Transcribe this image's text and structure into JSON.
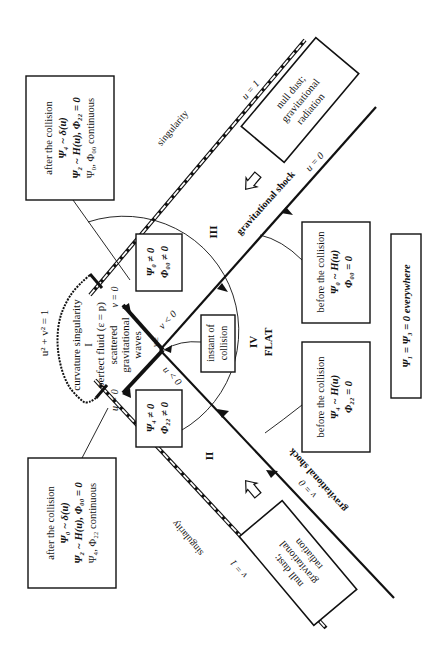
{
  "diagram": {
    "orientation": "rotated 90 degrees counter-clockwise",
    "regions": {
      "I": "I",
      "II": "II",
      "III": "III",
      "IV": "IV",
      "flat": "FLAT"
    },
    "region_I_text": {
      "singularity": "curvature singularity",
      "fluid": "perfect fluid (ε = p)",
      "scattered": "scattered",
      "gravitational": "gravitational",
      "waves": "waves"
    },
    "circle_label": "u² + v² = 1",
    "axis_labels": {
      "u_eq_0_top": "u = 0",
      "v_eq_0_bottom": "v = 0",
      "u_eq_1": "u = 1",
      "v_eq_1": "v = 1",
      "v_eq_0_left": "v = 0",
      "u_eq_0_left": "u = 0",
      "v_lt_0": "v < 0",
      "u_lt_0": "u < 0",
      "v_ge": "v ≥",
      "u_ge": "u ≥"
    },
    "singularity_top": "singularity",
    "singularity_bottom": "singularity",
    "shock_top": "gravitational shock",
    "shock_bottom": "gravitational shock",
    "null_dust_top": [
      "null dust;",
      "gravitational",
      "radiation"
    ],
    "null_dust_bottom": [
      "null dust;",
      "gravitational",
      "radiation"
    ],
    "after_top": {
      "title": "after the collision",
      "line1": "Ψ₄ ~ δ(u)",
      "line2": "Ψ₂ ~ H(u),  Φ₂₂ = 0",
      "line3": "Ψ₀, Φ₀₀ continuous"
    },
    "after_bottom": {
      "title": "after the collision",
      "line1": "Ψ₀ ~ δ(u)",
      "line2": "Ψ₂ ~ H(u),  Φ₀₀ = 0",
      "line3": "Ψ₄, Φ₂₂ continuous"
    },
    "box_psi0": {
      "line1": "Ψ₀ ≠ 0",
      "line2": "Φ₀₀ ≠ 0"
    },
    "box_psi4": {
      "line1": "Ψ₄ ≠ 0",
      "line2": "Φ₂₂ ≠ 0"
    },
    "instant": {
      "line1": "instant of",
      "line2": "collision"
    },
    "before_top": {
      "title": "before the collision",
      "line1": "Ψ₀ ~ H(u)",
      "line2": "Φ₀₀ = 0"
    },
    "before_bottom": {
      "title": "before the collision",
      "line1": "Ψ₄ ~ H(u)",
      "line2": "Φ₂₂ = 0"
    },
    "everywhere": "Ψ₁ = Ψ₃ = 0 everywhere"
  }
}
